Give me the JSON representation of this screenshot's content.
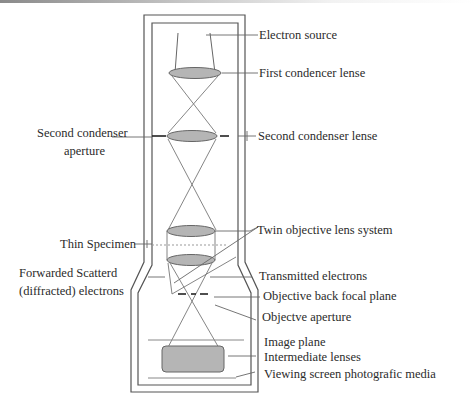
{
  "diagram": {
    "type": "transmission-electron-microscope-schematic",
    "labels": {
      "electron_source": "Electron source",
      "first_condenser_lense": "First condencer lense",
      "second_condenser_aperture_1": "Second condenser",
      "second_condenser_aperture_2": "aperture",
      "second_condenser_lense": "Second condenser lense",
      "twin_objective": "Twin objective lens system",
      "thin_specimen": "Thin Specimen",
      "forwarded_scattered_1": "Forwarded Scatterd",
      "forwarded_scattered_2": "(diffracted) electrons",
      "transmitted_electrons": "Transmitted electrons",
      "objective_back_focal_plane": "Objective back focal plane",
      "objective_aperture": "Objectve aperture",
      "image_plane": "Image plane",
      "intermediate_lenses": "Intermediate lenses",
      "viewing_screen": "Viewing screen photografic media"
    },
    "colors": {
      "line": "#555555",
      "lens_fill": "#b5b5b5",
      "text": "#2b2b2b"
    }
  }
}
